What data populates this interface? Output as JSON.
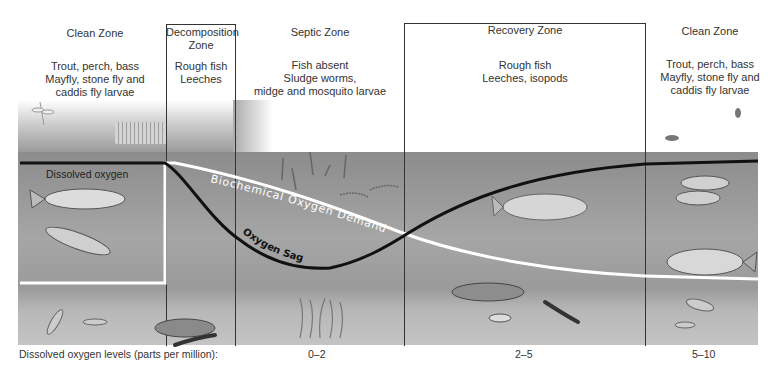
{
  "diagram": {
    "zones": [
      {
        "name": "Clean Zone",
        "organisms": [
          "Trout, perch, bass",
          "Mayfly, stone fly and",
          "caddis fly larvae"
        ]
      },
      {
        "name_line1": "Decomposition",
        "name_line2": "Zone",
        "organisms": [
          "Rough fish",
          "Leeches"
        ]
      },
      {
        "name": "Septic Zone",
        "organisms": [
          "Fish absent",
          "Sludge worms,",
          "midge and mosquito larvae"
        ]
      },
      {
        "name": "Recovery Zone",
        "organisms": [
          "Rough fish",
          "Leeches, isopods"
        ]
      },
      {
        "name": "Clean Zone",
        "organisms": [
          "Trout, perch, bass",
          "Mayfly, stone fly and",
          "caddis fly larvae"
        ]
      }
    ],
    "curves": {
      "dissolved_oxygen_label": "Dissolved oxygen",
      "bod_label": "Biochemical Oxygen Demand",
      "sag_label": "Oxygen Sag",
      "do_color": "#111111",
      "bod_color": "#ffffff"
    },
    "footer": {
      "label": "Dissolved oxygen levels (parts per million):",
      "levels": [
        "0–2",
        "2–5",
        "5–10"
      ]
    },
    "icons": [
      "dragonfly-icon",
      "fly-icon",
      "trout-icon",
      "perch-icon",
      "bass-icon",
      "carp-icon",
      "catfish-icon",
      "leech-icon",
      "sludge-worms-icon",
      "mosquito-larvae-icon",
      "isopod-icon",
      "mayfly-larva-icon",
      "drainage-pipe-icon"
    ]
  }
}
